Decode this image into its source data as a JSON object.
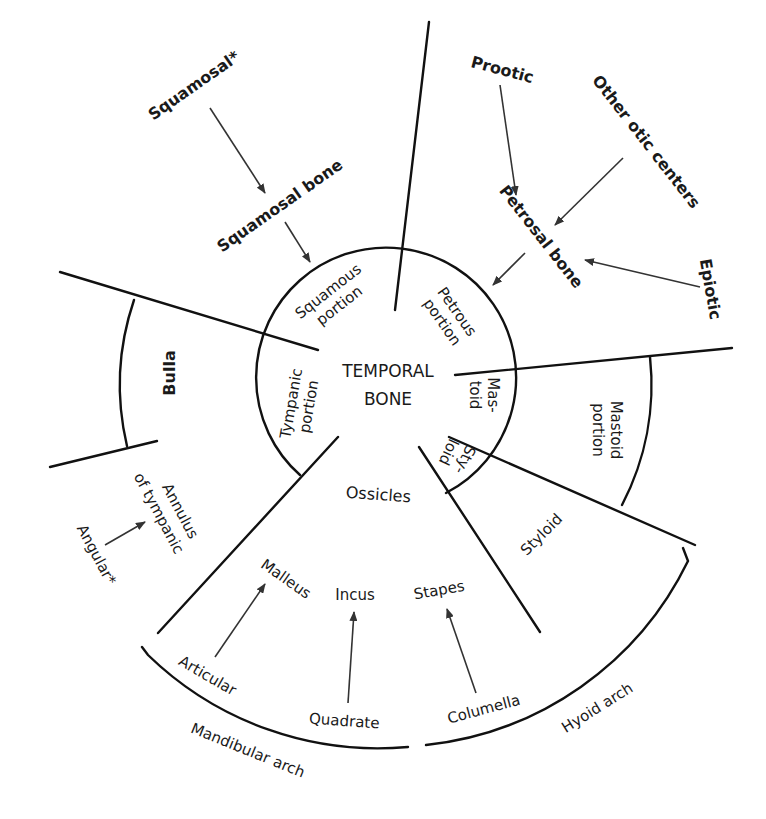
{
  "center": {
    "line1": "TEMPORAL",
    "line2": "BONE"
  },
  "inner_portions": {
    "squamous": [
      "Squamous",
      "portion"
    ],
    "petrous": [
      "Petrous",
      "portion"
    ],
    "tympanic": [
      "Tympanic",
      "portion"
    ],
    "mastoid": [
      "Mas-",
      "toid"
    ],
    "styloid": [
      "Sty-",
      "loid"
    ],
    "ossicles": "Ossicles"
  },
  "outer_regions": {
    "bulla": "Bulla",
    "annulus": [
      "Annulus",
      "of tympanic"
    ],
    "mastoid_portion": [
      "Mastoid",
      "portion"
    ],
    "styloid": "Styloid"
  },
  "ossicles": {
    "malleus": "Malleus",
    "incus": "Incus",
    "stapes": "Stapes"
  },
  "precursors": {
    "squamosal_star": "Squamosal*",
    "squamosal_bone": "Squamosal bone",
    "prootic": "Prootic",
    "other_otic": "Other otic centers",
    "petrosal_bone": "Petrosal bone",
    "epiotic": "Epiotic",
    "angular_star": "Angular*",
    "articular": "Articular",
    "quadrate": "Quadrate",
    "columella": "Columella"
  },
  "arches": {
    "mandibular": "Mandibular arch",
    "hyoid": "Hyoid arch"
  },
  "colors": {
    "ink": "#111111",
    "arrow": "#333333",
    "background": "#ffffff"
  }
}
